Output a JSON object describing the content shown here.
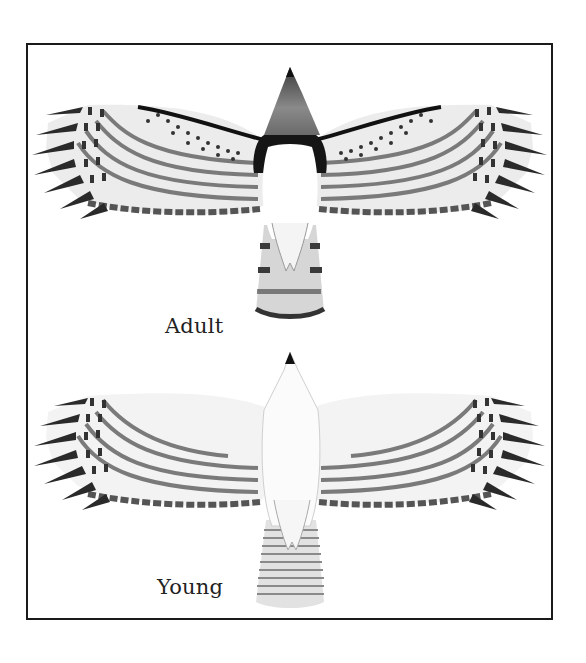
{
  "plate": {
    "subject": "Hawk, underside view in flight",
    "figures": [
      {
        "id": "adult",
        "label": "Adult"
      },
      {
        "id": "young",
        "label": "Young"
      }
    ]
  },
  "colors": {
    "frame": "#1a1a1a",
    "ink_dark": "#1f1f1f",
    "band_grey": "#6e6e6e",
    "feather_light": "#e6e6e6",
    "background": "#ffffff"
  }
}
